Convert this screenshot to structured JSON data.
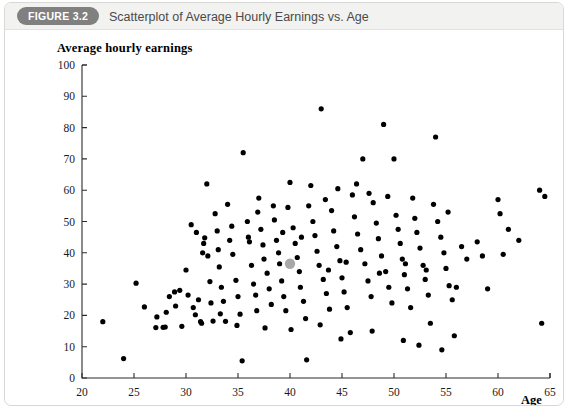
{
  "header": {
    "badge_label": "FIGURE 3.2",
    "title": "Scatterplot of Average Hourly Earnings vs. Age",
    "badge_color": "#808080",
    "bar_color": "#f2f2f0",
    "title_color": "#4a4a4a"
  },
  "chart_data": {
    "type": "scatter",
    "title": "Scatterplot of Average Hourly Earnings vs. Age",
    "xlabel": "Age",
    "ylabel": "Average hourly earnings",
    "xlim": [
      20,
      65
    ],
    "ylim": [
      0,
      100
    ],
    "xticks": [
      20,
      25,
      30,
      35,
      40,
      45,
      50,
      55,
      60,
      65
    ],
    "yticks": [
      0,
      10,
      20,
      30,
      40,
      50,
      60,
      70,
      80,
      90,
      100
    ],
    "grid": false,
    "legend": null,
    "point_color": "#000000",
    "point_radius": 2.6,
    "highlight": {
      "x": 40.0,
      "y": 36.5,
      "color": "#a8a8a8",
      "radius": 5.2,
      "note": "highlighted mean point"
    },
    "points": [
      [
        22.0,
        18.0
      ],
      [
        24.0,
        6.2
      ],
      [
        25.2,
        30.3
      ],
      [
        26.0,
        22.7
      ],
      [
        27.1,
        16.1
      ],
      [
        27.2,
        19.5
      ],
      [
        27.8,
        16.2
      ],
      [
        28.0,
        16.3
      ],
      [
        28.1,
        21.0
      ],
      [
        28.9,
        27.5
      ],
      [
        29.0,
        23.0
      ],
      [
        29.6,
        16.5
      ],
      [
        30.0,
        34.5
      ],
      [
        30.2,
        26.5
      ],
      [
        30.9,
        20.2
      ],
      [
        31.2,
        25.0
      ],
      [
        31.4,
        18.0
      ],
      [
        31.5,
        17.5
      ],
      [
        31.6,
        40.0
      ],
      [
        31.7,
        43.0
      ],
      [
        31.8,
        44.8
      ],
      [
        32.0,
        62.0
      ],
      [
        32.1,
        39.0
      ],
      [
        32.3,
        30.8
      ],
      [
        32.4,
        24.0
      ],
      [
        32.6,
        18.2
      ],
      [
        33.0,
        47.0
      ],
      [
        33.1,
        41.0
      ],
      [
        33.2,
        35.5
      ],
      [
        33.4,
        29.0
      ],
      [
        33.6,
        24.5
      ],
      [
        33.8,
        18.1
      ],
      [
        34.0,
        55.5
      ],
      [
        34.2,
        44.0
      ],
      [
        34.5,
        39.5
      ],
      [
        34.8,
        31.2
      ],
      [
        35.0,
        26.0
      ],
      [
        35.2,
        20.4
      ],
      [
        35.4,
        5.5
      ],
      [
        35.5,
        72.0
      ],
      [
        35.9,
        50.0
      ],
      [
        36.0,
        45.0
      ],
      [
        36.1,
        43.5
      ],
      [
        36.3,
        36.0
      ],
      [
        36.5,
        30.0
      ],
      [
        36.7,
        26.5
      ],
      [
        37.0,
        57.5
      ],
      [
        37.2,
        47.5
      ],
      [
        37.4,
        42.5
      ],
      [
        37.5,
        38.0
      ],
      [
        37.8,
        33.5
      ],
      [
        38.0,
        28.5
      ],
      [
        38.2,
        23.5
      ],
      [
        38.5,
        50.5
      ],
      [
        38.7,
        44.0
      ],
      [
        38.9,
        40.0
      ],
      [
        39.0,
        36.5
      ],
      [
        39.2,
        31.0
      ],
      [
        39.4,
        26.0
      ],
      [
        39.6,
        21.5
      ],
      [
        40.0,
        62.5
      ],
      [
        40.3,
        48.0
      ],
      [
        40.5,
        43.0
      ],
      [
        40.7,
        38.5
      ],
      [
        40.9,
        34.0
      ],
      [
        41.0,
        29.0
      ],
      [
        41.3,
        24.5
      ],
      [
        41.5,
        19.0
      ],
      [
        41.6,
        5.8
      ],
      [
        42.0,
        61.5
      ],
      [
        42.2,
        50.0
      ],
      [
        42.4,
        45.5
      ],
      [
        42.6,
        40.5
      ],
      [
        42.8,
        36.0
      ],
      [
        43.0,
        86.0
      ],
      [
        43.2,
        31.5
      ],
      [
        43.5,
        27.0
      ],
      [
        43.8,
        22.0
      ],
      [
        44.0,
        53.5
      ],
      [
        44.2,
        47.0
      ],
      [
        44.5,
        42.0
      ],
      [
        44.8,
        37.5
      ],
      [
        45.0,
        32.0
      ],
      [
        45.2,
        27.5
      ],
      [
        45.5,
        22.5
      ],
      [
        45.8,
        14.5
      ],
      [
        46.0,
        58.5
      ],
      [
        46.2,
        51.5
      ],
      [
        46.5,
        46.0
      ],
      [
        46.8,
        41.0
      ],
      [
        47.0,
        70.0
      ],
      [
        47.2,
        36.5
      ],
      [
        47.5,
        31.0
      ],
      [
        47.8,
        26.0
      ],
      [
        48.0,
        56.0
      ],
      [
        48.3,
        49.5
      ],
      [
        48.5,
        44.5
      ],
      [
        48.8,
        39.0
      ],
      [
        49.0,
        81.0
      ],
      [
        49.2,
        34.0
      ],
      [
        49.5,
        29.0
      ],
      [
        49.8,
        24.0
      ],
      [
        50.0,
        70.0
      ],
      [
        50.2,
        52.0
      ],
      [
        50.4,
        47.5
      ],
      [
        50.6,
        43.0
      ],
      [
        50.8,
        38.0
      ],
      [
        51.0,
        33.0
      ],
      [
        51.3,
        28.5
      ],
      [
        51.6,
        22.5
      ],
      [
        52.0,
        51.0
      ],
      [
        52.2,
        46.5
      ],
      [
        52.5,
        41.5
      ],
      [
        52.8,
        36.0
      ],
      [
        53.0,
        31.5
      ],
      [
        53.3,
        26.5
      ],
      [
        53.5,
        17.5
      ],
      [
        54.0,
        77.0
      ],
      [
        54.2,
        50.0
      ],
      [
        54.5,
        45.0
      ],
      [
        54.8,
        40.0
      ],
      [
        55.0,
        35.0
      ],
      [
        55.3,
        29.5
      ],
      [
        55.6,
        25.0
      ],
      [
        55.8,
        13.5
      ],
      [
        56.5,
        42.0
      ],
      [
        57.0,
        38.0
      ],
      [
        58.0,
        43.5
      ],
      [
        58.5,
        39.0
      ],
      [
        59.0,
        28.5
      ],
      [
        60.0,
        57.0
      ],
      [
        60.2,
        52.5
      ],
      [
        60.5,
        39.5
      ],
      [
        61.0,
        47.5
      ],
      [
        62.0,
        44.0
      ],
      [
        64.0,
        60.0
      ],
      [
        64.5,
        58.0
      ],
      [
        64.2,
        17.5
      ],
      [
        30.5,
        49.0
      ],
      [
        31.0,
        46.5
      ],
      [
        32.8,
        52.5
      ],
      [
        34.4,
        48.5
      ],
      [
        36.9,
        53.0
      ],
      [
        38.4,
        55.0
      ],
      [
        39.8,
        54.5
      ],
      [
        41.8,
        55.0
      ],
      [
        43.4,
        57.0
      ],
      [
        44.6,
        60.5
      ],
      [
        46.4,
        62.0
      ],
      [
        47.6,
        59.0
      ],
      [
        49.4,
        58.0
      ],
      [
        51.8,
        57.5
      ],
      [
        53.8,
        55.5
      ],
      [
        55.2,
        53.0
      ],
      [
        29.4,
        28.0
      ],
      [
        30.7,
        22.5
      ],
      [
        33.3,
        20.5
      ],
      [
        34.9,
        16.8
      ],
      [
        37.6,
        16.0
      ],
      [
        40.1,
        15.5
      ],
      [
        42.9,
        17.0
      ],
      [
        44.9,
        12.5
      ],
      [
        47.9,
        15.0
      ],
      [
        50.9,
        12.0
      ],
      [
        52.4,
        10.5
      ],
      [
        54.6,
        9.0
      ],
      [
        28.4,
        26.0
      ],
      [
        36.8,
        21.5
      ],
      [
        39.3,
        46.5
      ],
      [
        41.1,
        45.0
      ],
      [
        43.7,
        34.5
      ],
      [
        45.4,
        37.0
      ],
      [
        48.6,
        33.5
      ],
      [
        51.1,
        36.5
      ],
      [
        53.1,
        34.5
      ],
      [
        56.0,
        29.0
      ]
    ]
  }
}
